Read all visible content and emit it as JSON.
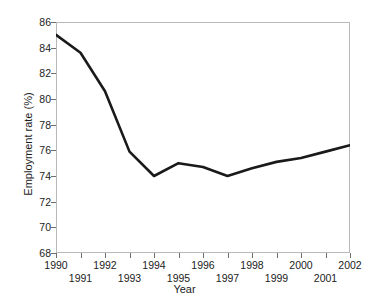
{
  "chart_data": {
    "type": "line",
    "title": "",
    "xlabel": "Year",
    "ylabel": "Employment rate (%)",
    "xlim": [
      1990,
      2002
    ],
    "ylim": [
      68,
      86
    ],
    "grid": false,
    "legend": false,
    "line_color": "#1a1a1a",
    "frame_color": "#b9b9b9",
    "x": [
      1990,
      1991,
      1992,
      1993,
      1994,
      1995,
      1996,
      1997,
      1998,
      1999,
      2000,
      2001,
      2002
    ],
    "values": [
      85.0,
      83.6,
      80.6,
      75.9,
      74.0,
      75.0,
      74.7,
      74.0,
      74.6,
      75.1,
      75.4,
      75.9,
      76.4
    ],
    "series": [
      {
        "name": "Employment rate",
        "values": [
          85.0,
          83.6,
          80.6,
          75.9,
          74.0,
          75.0,
          74.7,
          74.0,
          74.6,
          75.1,
          75.4,
          75.9,
          76.4
        ]
      }
    ],
    "ytick_labels": [
      "86",
      "84",
      "82",
      "80",
      "78",
      "76",
      "74",
      "72",
      "70",
      "68"
    ],
    "ytick_values": [
      86,
      84,
      82,
      80,
      78,
      76,
      74,
      72,
      70,
      68
    ],
    "xtick_labels_top": [
      "1990",
      "1992",
      "1994",
      "1996",
      "1998",
      "2000",
      "2002"
    ],
    "xtick_values_top": [
      1990,
      1992,
      1994,
      1996,
      1998,
      2000,
      2002
    ],
    "xtick_labels_bottom": [
      "1991",
      "1993",
      "1995",
      "1997",
      "1999",
      "2001"
    ],
    "xtick_values_bottom": [
      1991,
      1993,
      1995,
      1997,
      1999,
      2001
    ]
  }
}
